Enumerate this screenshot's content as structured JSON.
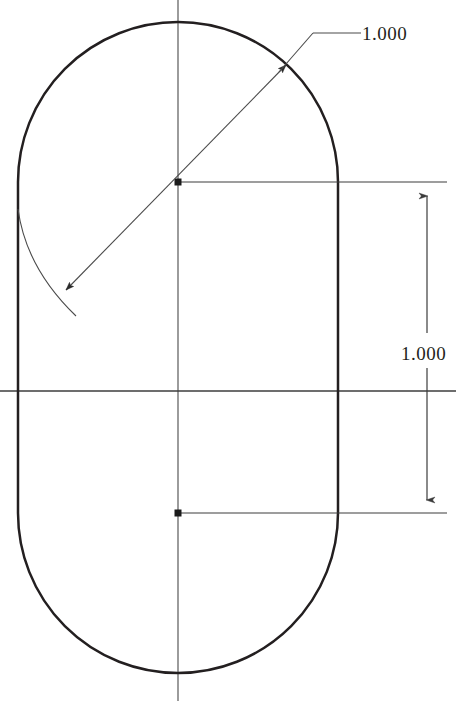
{
  "drawing": {
    "title": "Slot profile drawing",
    "background_color": "#ffffff",
    "line_color": "#231f20",
    "construction_line_color": "#555555",
    "profile": {
      "name": "slot-outline",
      "shape": "stadium",
      "left_edge_x": 18,
      "right_edge_x": 340,
      "top_apex_y": 11,
      "bottom_apex_y": 683,
      "arc_radius": 161,
      "upper_center": {
        "x": 178,
        "y": 182
      },
      "lower_center": {
        "x": 178,
        "y": 513
      }
    },
    "centerlines": {
      "vertical_x": 178,
      "vertical_top_y": 0,
      "vertical_bottom_y": 701,
      "horizontal_y": 391,
      "horizontal_left_x": 0,
      "horizontal_right_x": 456
    },
    "center_marks": [
      {
        "name": "upper-arc-center-point",
        "x": 178,
        "y": 182
      },
      {
        "name": "lower-arc-center-point",
        "x": 178,
        "y": 513
      }
    ],
    "dimensions": [
      {
        "id": "radius-dimension",
        "name": "diameter-dimension",
        "value": "1.000",
        "type": "leader",
        "text_x": 362,
        "text_y": 23,
        "shelf_start_x": 313,
        "shelf_end_x": 360,
        "shelf_y": 33,
        "leader_elbow_x": 313,
        "leader_elbow_y": 33,
        "arrow_tip_1": {
          "x": 279,
          "y": 72
        },
        "arrow_tip_2": {
          "x": 63,
          "y": 293
        }
      },
      {
        "id": "height-dimension",
        "name": "center-distance-dimension",
        "value": "1.000",
        "type": "linear-vertical",
        "text_x": 401,
        "text_y": 343,
        "dim_line_x": 427,
        "dim_line_top_y": 183,
        "dim_line_bottom_y": 513,
        "extension_upper_y": 182,
        "extension_lower_y": 513,
        "extension_left_x": 180,
        "extension_right_x": 447,
        "arrow_up_tip_y": 184,
        "arrow_down_tip_y": 512
      }
    ],
    "extension_lines": [
      {
        "name": "upper-extension-line",
        "x1": 180,
        "y1": 182,
        "x2": 447,
        "y2": 182
      },
      {
        "name": "lower-extension-line",
        "x1": 180,
        "y1": 513,
        "x2": 447,
        "y2": 513
      }
    ],
    "radius_arc_witness": {
      "name": "radius-witness-arc",
      "start_x": 18,
      "start_y": 211,
      "end_x": 73,
      "end_y": 311
    }
  }
}
